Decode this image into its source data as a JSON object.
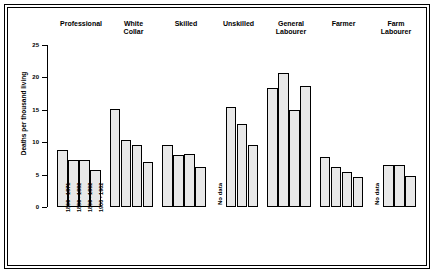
{
  "chart_data": {
    "type": "bar",
    "title": "",
    "xlabel": "",
    "ylabel": "Deaths per thousand living",
    "ylim": [
      0,
      25
    ],
    "yticks": [
      0,
      5,
      10,
      15,
      20,
      25
    ],
    "grid": false,
    "legend_position": "none",
    "categories": [
      "Professional",
      "White Collar",
      "Skilled",
      "Unskilled",
      "General Labourer",
      "Farmer",
      "Farm Labourer"
    ],
    "periods": [
      "1860 - 1871",
      "1880 - 1882",
      "1890 - 1892",
      "1900 - 1902"
    ],
    "no_data_label": "No data",
    "series": [
      {
        "name": "1860 - 1871",
        "values": [
          8.8,
          15.2,
          9.6,
          null,
          18.4,
          7.7,
          null
        ]
      },
      {
        "name": "1880 - 1882",
        "values": [
          7.2,
          10.4,
          8.0,
          15.4,
          20.7,
          6.2,
          6.5
        ]
      },
      {
        "name": "1890 - 1892",
        "values": [
          7.2,
          9.5,
          8.2,
          12.8,
          14.9,
          5.4,
          6.5
        ]
      },
      {
        "name": "1900 - 1902",
        "values": [
          5.7,
          6.9,
          6.2,
          9.6,
          18.6,
          4.7,
          4.8
        ]
      }
    ],
    "groups": [
      {
        "label": "Professional",
        "label_lines": [
          "Professional"
        ],
        "no_data": false,
        "bars": [
          8.8,
          7.2,
          7.2,
          5.7
        ]
      },
      {
        "label": "White Collar",
        "label_lines": [
          "White",
          "Collar"
        ],
        "no_data": false,
        "bars": [
          15.2,
          10.4,
          9.5,
          6.9
        ]
      },
      {
        "label": "Skilled",
        "label_lines": [
          "Skilled"
        ],
        "no_data": false,
        "bars": [
          9.6,
          8.0,
          8.2,
          6.2
        ]
      },
      {
        "label": "Unskilled",
        "label_lines": [
          "Unskilled"
        ],
        "no_data": true,
        "bars": [
          null,
          15.4,
          12.8,
          9.6
        ]
      },
      {
        "label": "General Labourer",
        "label_lines": [
          "General",
          "Labourer"
        ],
        "no_data": false,
        "bars": [
          18.4,
          20.7,
          14.9,
          18.6
        ]
      },
      {
        "label": "Farmer",
        "label_lines": [
          "Farmer"
        ],
        "no_data": false,
        "bars": [
          7.7,
          6.2,
          5.4,
          4.7
        ]
      },
      {
        "label": "Farm Labourer",
        "label_lines": [
          "Farm",
          "Labourer"
        ],
        "no_data": true,
        "bars": [
          null,
          6.5,
          6.5,
          4.8
        ]
      }
    ]
  }
}
